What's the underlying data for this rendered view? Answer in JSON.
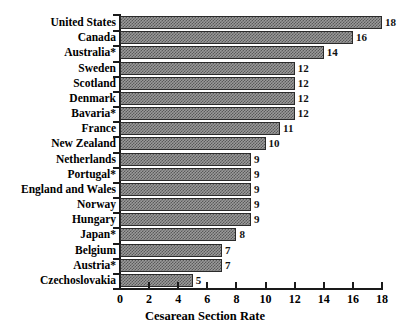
{
  "chart_data": {
    "type": "bar",
    "orientation": "horizontal",
    "title": "",
    "xlabel": "Cesarean Section Rate",
    "ylabel": "",
    "xlim": [
      0,
      18
    ],
    "xticks": [
      0,
      2,
      4,
      6,
      8,
      10,
      12,
      14,
      16,
      18
    ],
    "grid": false,
    "legend": null,
    "categories": [
      "United States",
      "Canada",
      "Australia*",
      "Sweden",
      "Scotland",
      "Denmark",
      "Bavaria*",
      "France",
      "New Zealand",
      "Netherlands",
      "Portugal*",
      "England and Wales",
      "Norway",
      "Hungary",
      "Japan*",
      "Belgium",
      "Austria*",
      "Czechoslovakia"
    ],
    "values": [
      18,
      16,
      14,
      12,
      12,
      12,
      12,
      11,
      10,
      9,
      9,
      9,
      9,
      9,
      8,
      7,
      7,
      5
    ],
    "value_labels": [
      "18",
      "16",
      "14",
      "12",
      "12",
      "12",
      "12",
      "11",
      "10",
      "9",
      "9",
      "9",
      "9",
      "9",
      "8",
      "7",
      "7",
      "5"
    ],
    "bar_color": "#9a9a9a",
    "bar_edge_color": "#2b2b2b",
    "axis_color": "#1a1a1a",
    "background_color": "#ffffff"
  }
}
